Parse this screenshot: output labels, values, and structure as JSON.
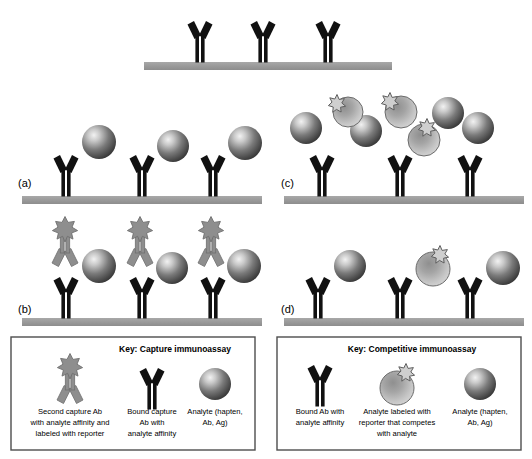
{
  "figure": {
    "panels": [
      {
        "id": "top",
        "label": "",
        "description": "Capture antibodies immobilized on substrate"
      },
      {
        "id": "a",
        "label": "(a)",
        "description": "Analyte bound to capture antibody"
      },
      {
        "id": "b",
        "label": "(b)",
        "description": "Second capture antibody labeled with reporter forms sandwich"
      },
      {
        "id": "c",
        "label": "(c)",
        "description": "Free analyte and reporter-labeled analyte compete in solution"
      },
      {
        "id": "d",
        "label": "(d)",
        "description": "Competitive binding outcome at the surface"
      }
    ]
  },
  "legend_left": {
    "title": "Key: Capture immunoassay",
    "items": [
      {
        "icon": "reporter-labeled-antibody-icon",
        "caption_lines": [
          "Second capture Ab",
          "with analyte affinity and",
          "labeled with reporter"
        ]
      },
      {
        "icon": "bound-antibody-icon",
        "caption_lines": [
          "Bound capture",
          "Ab with",
          "analyte affinity"
        ]
      },
      {
        "icon": "analyte-sphere-icon",
        "caption_lines": [
          "Analyte (hapten,",
          "Ab, Ag)"
        ]
      }
    ]
  },
  "legend_right": {
    "title": "Key: Competitive immunoassay",
    "items": [
      {
        "icon": "bound-antibody-icon",
        "caption_lines": [
          "Bound Ab with",
          "analyte affinity"
        ]
      },
      {
        "icon": "labeled-analyte-icon",
        "caption_lines": [
          "Analyte labeled with",
          "reporter that competes",
          "with analyte"
        ]
      },
      {
        "icon": "analyte-sphere-icon",
        "caption_lines": [
          "Analyte (hapten,",
          "Ab, Ag)"
        ]
      }
    ]
  },
  "colors": {
    "substrate": "#9a9a9a",
    "antibody_dark": "#111111",
    "antibody_gray": "#8e8e8e",
    "analyte_dark": "#4a4a4a",
    "analyte_light": "#b4b4b4",
    "border": "#4d4d4d",
    "background": "#ffffff"
  }
}
